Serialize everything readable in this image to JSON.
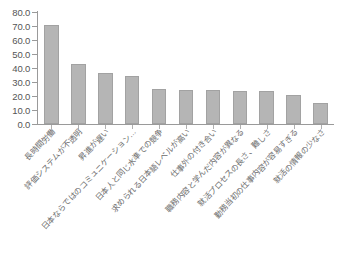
{
  "chart_data": {
    "type": "bar",
    "title": "",
    "xlabel": "",
    "ylabel": "",
    "ylim": [
      0.0,
      80.0
    ],
    "ytick_labels": [
      "80.0",
      "70.0",
      "60.0",
      "50.0",
      "40.0",
      "30.0",
      "20.0",
      "10.0",
      "0.0"
    ],
    "ytick_values": [
      80.0,
      70.0,
      60.0,
      50.0,
      40.0,
      30.0,
      20.0,
      10.0,
      0.0
    ],
    "grid": false,
    "legend": false,
    "bar_color": "#b5b5b5",
    "bar_border_color": "#a2a2a2",
    "axis_color": "#9a9a9a",
    "categories": [
      "長時間労働",
      "評価システムが不透明",
      "昇進が遅い",
      "日本ならではのコミュニケーション…",
      "日本人と同じ水準での競争",
      "求められる日本語レベルが高い",
      "仕事外の付き合い",
      "職務内容と学んだ内容が異なる",
      "就活プロセスの長さ、難しさ",
      "勤務当初の仕事内容が容易すぎる",
      "就活の情報の少なさ"
    ],
    "categories_display": [
      "長時間労働",
      "評価システムが不透明",
      "昇進が遅い",
      "日本ならではのコミュニケーション…",
      "日本人と同じ水準での競争",
      "求められる日本語レベルが高い",
      "仕事外の付き合い",
      "職務内容と学んだ内容が異なる",
      "就活プロセスの長さ、難しさ",
      "勤務当初の仕事内容が容易すぎる",
      "就活の情報の少なさ"
    ],
    "values": [
      70.7,
      42.9,
      36.4,
      34.3,
      25.0,
      24.3,
      24.3,
      23.6,
      23.6,
      20.7,
      15.0
    ]
  }
}
